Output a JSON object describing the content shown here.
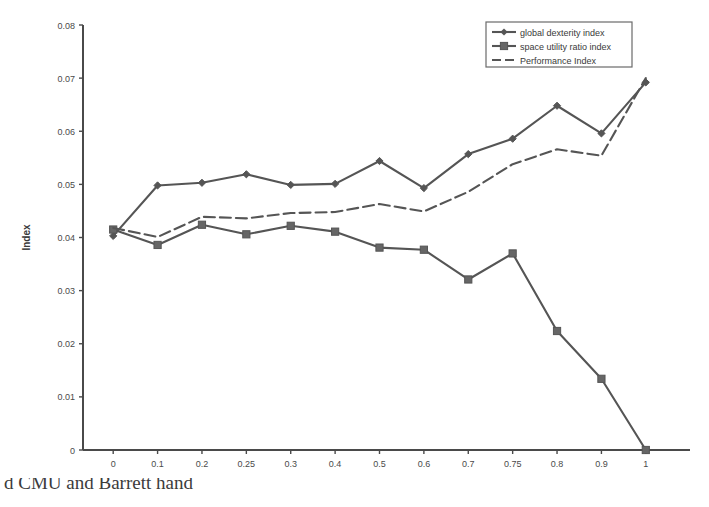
{
  "chart_data": {
    "type": "line",
    "title": "",
    "xlabel": "weight parameter",
    "ylabel": "Index",
    "categories": [
      "0",
      "0.1",
      "0.2",
      "0.25",
      "0.3",
      "0.4",
      "0.5",
      "0.6",
      "0.7",
      "0.75",
      "0.8",
      "0.9",
      "1"
    ],
    "x_tick_labels": [
      "0",
      "0.1",
      "0.2",
      "0.25",
      "0.3",
      "0.4",
      "0.5",
      "0.6",
      "0.7",
      "0.75",
      "0.8",
      "0.9",
      "1"
    ],
    "y_tick_labels": [
      "0",
      "0.01",
      "0.02",
      "0.03",
      "0.04",
      "0.05",
      "0.06",
      "0.07",
      "0.08"
    ],
    "y_tick_values": [
      0,
      0.01,
      0.02,
      0.03,
      0.04,
      0.05,
      0.06,
      0.07,
      0.08
    ],
    "ylim": [
      0,
      0.08
    ],
    "grid": false,
    "legend_position": "top-right",
    "series": [
      {
        "name": "global dexterity index",
        "marker": "diamond",
        "line_style": "solid",
        "color": "#555555",
        "values": [
          0.0403,
          0.0498,
          0.0503,
          0.0519,
          0.0499,
          0.0501,
          0.0544,
          0.0493,
          0.0557,
          0.0586,
          0.0648,
          0.0596,
          0.0692
        ]
      },
      {
        "name": "space utility ratio index",
        "marker": "square",
        "line_style": "solid",
        "color": "#555555",
        "values": [
          0.0415,
          0.0386,
          0.0424,
          0.0406,
          0.0422,
          0.0411,
          0.0381,
          0.0377,
          0.0321,
          0.037,
          0.0224,
          0.0134,
          0.0
        ]
      },
      {
        "name": "Performance Index",
        "marker": "none",
        "line_style": "dashed",
        "color": "#555555",
        "values": [
          0.0418,
          0.0401,
          0.0439,
          0.0436,
          0.0446,
          0.0448,
          0.0463,
          0.0449,
          0.0486,
          0.0538,
          0.0566,
          0.0554,
          0.07
        ]
      }
    ],
    "legend_entries": [
      "global dexterity index",
      "space utility ratio index",
      "Performance Index"
    ]
  },
  "caption": {
    "partial_text": "d CMU and Barrett hand"
  }
}
